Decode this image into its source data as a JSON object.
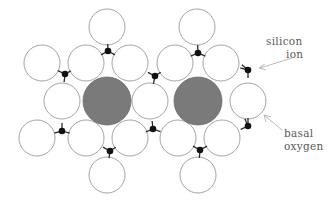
{
  "diagram": {
    "type": "crystal-structure-sheet",
    "labels": {
      "silicon_line1": "silicon",
      "silicon_line2": "ion",
      "oxygen_line1": "basal",
      "oxygen_line2": "oxygen"
    },
    "colors": {
      "oxygen_fill": "#ffffff",
      "oxygen_stroke": "#9a9a9a",
      "interlayer_cation_fill": "#7a7a7a",
      "silicon_fill": "#111111"
    },
    "oxygen_radius": 18,
    "cation_radius": 24,
    "basal_oxygens": [
      [
        107,
        27
      ],
      [
        197,
        27
      ],
      [
        42,
        63
      ],
      [
        86,
        63
      ],
      [
        130,
        63
      ],
      [
        175,
        63
      ],
      [
        221,
        63
      ],
      [
        62,
        101
      ],
      [
        150,
        101
      ],
      [
        248,
        101
      ],
      [
        37,
        138
      ],
      [
        86,
        138
      ],
      [
        130,
        138
      ],
      [
        178,
        138
      ],
      [
        222,
        138
      ],
      [
        107,
        175
      ],
      [
        198,
        175
      ]
    ],
    "interlayer_cations": [
      [
        107,
        101
      ],
      [
        198,
        101
      ]
    ],
    "silicon_ions": [
      [
        108,
        51
      ],
      [
        198,
        53
      ],
      [
        248,
        70
      ],
      [
        65,
        74
      ],
      [
        155,
        76
      ],
      [
        62,
        131
      ],
      [
        153,
        129
      ],
      [
        248,
        126
      ],
      [
        110,
        151
      ],
      [
        200,
        150
      ]
    ]
  }
}
